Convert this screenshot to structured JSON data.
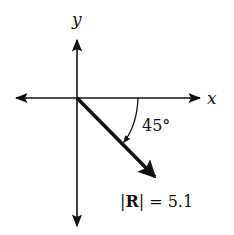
{
  "diagram": {
    "axes": {
      "x_label": "x",
      "y_label": "y"
    },
    "vector": {
      "name": "R",
      "magnitude_label": "|R| = 5.1",
      "magnitude": 5.1,
      "angle_label": "45°",
      "angle_deg": 45,
      "direction": "below positive x-axis"
    },
    "colors": {
      "ink": "#111111",
      "background": "#ffffff"
    }
  }
}
